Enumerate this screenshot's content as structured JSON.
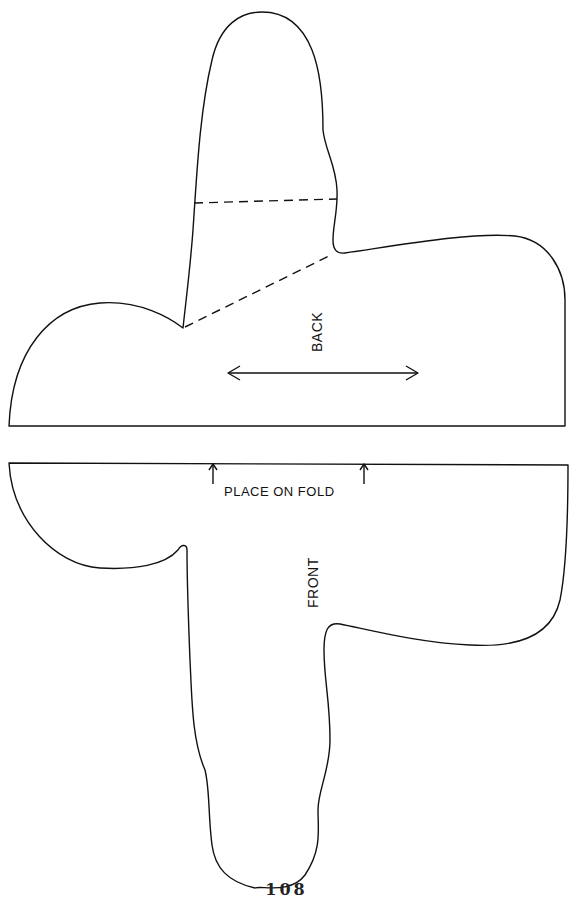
{
  "pieces": {
    "back": {
      "label": "BACK",
      "fold_line": "dashed",
      "grainline": "double-arrow"
    },
    "front": {
      "label": "FRONT",
      "fold_instruction": "PLACE ON FOLD"
    }
  },
  "page_number": "108",
  "colors": {
    "line": "#111111",
    "paper": "#ffffff"
  }
}
